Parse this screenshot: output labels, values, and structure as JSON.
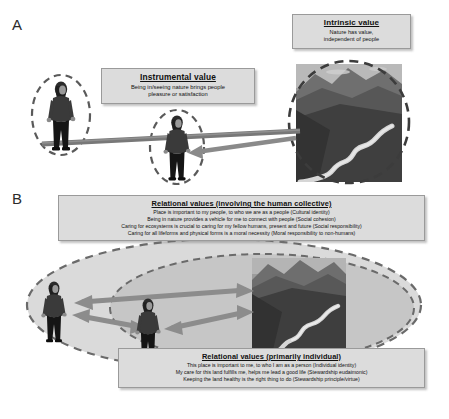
{
  "figure": {
    "panels": [
      {
        "letter": "A",
        "name": "instrumental-intrinsic-panel"
      },
      {
        "letter": "B",
        "name": "relational-values-panel"
      }
    ]
  },
  "panel_a": {
    "letter": "A",
    "intrinsic_box": {
      "title": "Intrinsic value",
      "lines": [
        "Nature has value,",
        "independent of people"
      ]
    },
    "instrumental_box": {
      "title": "Instrumental value",
      "lines": [
        "Being in/seeing nature brings people",
        "pleasure or satisfaction"
      ]
    },
    "elements": {
      "person_left": "person-figure-left",
      "person_center": "person-figure-center",
      "nature_image": "nature-landscape-image",
      "arrow": "arrow-nature-to-person"
    }
  },
  "panel_b": {
    "letter": "B",
    "collective_box": {
      "title": "Relational values (involving the human collective)",
      "lines": [
        "Place is important to my people, to who we are as a people (Cultural identity)",
        "Being in nature provides a vehicle for me to connect with people (Social cohesion)",
        "Caring for ecosystems is crucial to caring for my fellow humans, present and future (Social responsibility)",
        "Caring for all lifeforms and physical forms is a moral necessity (Moral responsibility to non-humans)"
      ]
    },
    "individual_box": {
      "title": "Relational values (primarily individual)",
      "lines": [
        "This place is important to me, to who I am as a person (Individual identity)",
        "My care for this land fulfills me, helps me lead a good life (Stewardship eudaimonic)",
        "Keeping the land healthy is the right thing to do (Stewardship principle/virtue)"
      ]
    },
    "elements": {
      "outer_ellipse": "outer-dashed-ellipse",
      "inner_ellipse": "inner-dashed-ellipse",
      "person_left": "person-figure-left",
      "person_center": "person-figure-center",
      "nature_image": "nature-landscape-image",
      "arrows": [
        "arrow-nature-to-person-left",
        "arrow-nature-to-person-center",
        "arrow-person-center-to-person-left"
      ]
    }
  },
  "colors": {
    "box_fill": "#dcdcdc",
    "box_border": "#9a9a9a",
    "dashed_ellipse": "#4d4d4d",
    "arrow": "#6e6e6e",
    "outer_ellipse_fill": "#d9d9d9",
    "inner_ellipse_fill": "#c4c4c4",
    "landscape_dark": "#3d3d3d",
    "landscape_mid": "#6b6b6b",
    "landscape_light": "#9c9c9c",
    "river": "#d8d8d8",
    "text": "#101010"
  }
}
